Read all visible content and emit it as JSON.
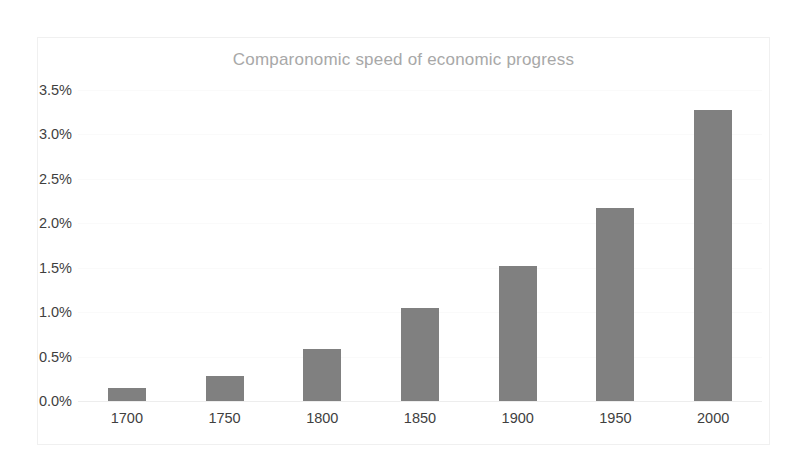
{
  "chart_data": {
    "type": "bar",
    "title": "Comparonomic speed of economic progress",
    "xlabel": "",
    "ylabel": "",
    "categories": [
      "1700",
      "1750",
      "1800",
      "1850",
      "1900",
      "1950",
      "2000"
    ],
    "values": [
      0.15,
      0.28,
      0.58,
      1.05,
      1.52,
      2.17,
      3.28
    ],
    "value_unit": "%",
    "ylim": [
      0.0,
      3.5
    ],
    "ytick_labels": [
      "0.0%",
      "0.5%",
      "1.0%",
      "1.5%",
      "2.0%",
      "2.5%",
      "3.0%",
      "3.5%"
    ],
    "ytick_values": [
      0.0,
      0.5,
      1.0,
      1.5,
      2.0,
      2.5,
      3.0,
      3.5
    ],
    "grid": true,
    "legend": false,
    "legend_position": "none",
    "series": [
      {
        "name": "Speed of economic progress",
        "values": [
          0.15,
          0.28,
          0.58,
          1.05,
          1.52,
          2.17,
          3.28
        ]
      }
    ]
  },
  "colors": {
    "bar": "#808080",
    "title_text": "#a8a8a8",
    "tick_text": "#3f3f3f",
    "gridline": "#fafafa",
    "frame": "#f0f0f0",
    "background": "#ffffff"
  }
}
